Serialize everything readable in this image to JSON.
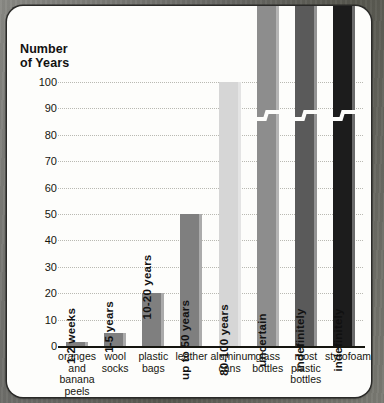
{
  "chart_data": {
    "type": "bar",
    "title": "",
    "xlabel": "",
    "ylabel": "Number of Years",
    "ylabel_lines": [
      "Number",
      "of Years"
    ],
    "ylim": [
      0,
      100
    ],
    "yticks": [
      100,
      90,
      80,
      70,
      60,
      50,
      40,
      30,
      20,
      10,
      0
    ],
    "grid": true,
    "legend": "none",
    "categories": [
      "oranges and banana peels",
      "wool socks",
      "plastic bags",
      "leather",
      "aluminum cans",
      "glass bottles",
      "most plastic bottles",
      "styrofoam"
    ],
    "category_lines": [
      [
        "oranges",
        "and",
        "banana",
        "peels"
      ],
      [
        "wool",
        "socks"
      ],
      [
        "plastic",
        "bags"
      ],
      [
        "leather"
      ],
      [
        "aluminum",
        "cans"
      ],
      [
        "glass",
        "bottles"
      ],
      [
        "most",
        "plastic",
        "bottles"
      ],
      [
        "styrofoam"
      ]
    ],
    "values": [
      1.5,
      5,
      20,
      50,
      100,
      130,
      130,
      130
    ],
    "value_labels": [
      "1-2 weeks",
      "1-5 years",
      "10-20 years",
      "up to 50 years",
      "80-100 years",
      "uncertain",
      "indefinitely",
      "indefinitely"
    ],
    "bar_colors": [
      "#7f7f7f",
      "#7f7f7f",
      "#7f7f7f",
      "#7f7f7f",
      "#d6d6d6",
      "#8d8d8d",
      "#5a5a5a",
      "#1c1c1c"
    ],
    "label_colors": [
      "#121212",
      "#121212",
      "#121212",
      "#121212",
      "#121212",
      "#121212",
      "#121212",
      "#101010"
    ],
    "axis_break": [
      false,
      false,
      false,
      false,
      false,
      true,
      true,
      true
    ]
  },
  "colors": {
    "card_background": "#fdfdfb",
    "page_background": "#6f6f6c",
    "axis": "#15150f",
    "gridline": "#b9b9b2",
    "text": "#16160f"
  }
}
